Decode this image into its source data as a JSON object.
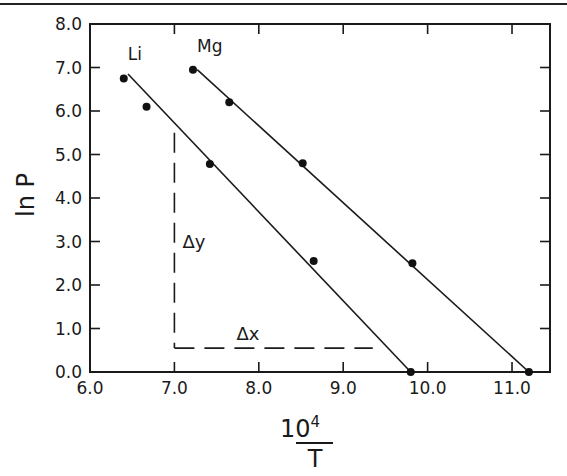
{
  "chart_data": {
    "type": "scatter",
    "title": "",
    "xlabel": "10^4/T",
    "xlabel_numerator": "10",
    "xlabel_exponent": "4",
    "xlabel_denominator": "T",
    "ylabel": "ln P",
    "xlim": [
      6.0,
      11.45
    ],
    "ylim": [
      0.0,
      8.0
    ],
    "grid": false,
    "x_ticks": [
      6.0,
      7.0,
      8.0,
      9.0,
      10.0,
      11.0
    ],
    "x_tick_labels": [
      "6.0",
      "7.0",
      "8.0",
      "9.0",
      "10.0",
      "11.0"
    ],
    "y_ticks": [
      0.0,
      1.0,
      2.0,
      3.0,
      4.0,
      5.0,
      6.0,
      7.0,
      8.0
    ],
    "y_tick_labels": [
      "0.0",
      "1.0",
      "2.0",
      "3.0",
      "4.0",
      "5.0",
      "6.0",
      "7.0",
      "8.0"
    ],
    "series": [
      {
        "name": "Li",
        "points": [
          [
            6.4,
            6.75
          ],
          [
            6.67,
            6.1
          ],
          [
            7.42,
            4.78
          ],
          [
            8.65,
            2.55
          ],
          [
            9.8,
            0.0
          ]
        ],
        "fit_line": [
          [
            6.45,
            6.85
          ],
          [
            9.8,
            0.0
          ]
        ]
      },
      {
        "name": "Mg",
        "points": [
          [
            7.22,
            6.95
          ],
          [
            7.65,
            6.2
          ],
          [
            8.52,
            4.8
          ],
          [
            9.82,
            2.5
          ],
          [
            11.2,
            0.0
          ]
        ],
        "fit_line": [
          [
            7.27,
            6.95
          ],
          [
            11.2,
            0.0
          ]
        ]
      }
    ],
    "annotations": [
      {
        "text": "Δy",
        "type": "dashed-vertical",
        "x": 7.0,
        "y_from": 5.5,
        "y_to": 0.55
      },
      {
        "text": "Δx",
        "type": "dashed-horizontal",
        "y": 0.55,
        "x_from": 7.0,
        "x_to": 9.35
      }
    ],
    "legend": "inline labels"
  }
}
